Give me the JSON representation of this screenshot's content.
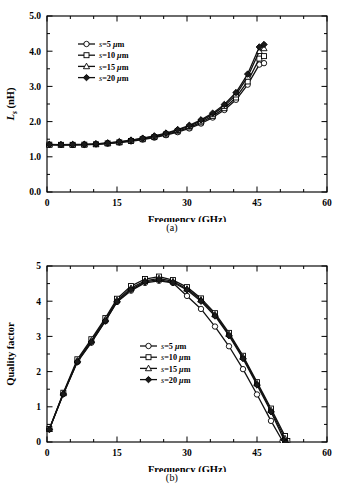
{
  "figure": {
    "panels": [
      {
        "id": "a",
        "caption": "(a)"
      },
      {
        "id": "b",
        "caption": "(b)"
      }
    ]
  },
  "chart_data": [
    {
      "type": "line",
      "panel": "a",
      "title": "",
      "xlabel": "Frequency (GHz)",
      "ylabel": "Ls (nH)",
      "ylabel_parts": {
        "main": "L",
        "sub": "s",
        "unit": " (nH)"
      },
      "xlim": [
        0,
        60
      ],
      "ylim": [
        0.0,
        5.0
      ],
      "xticks": [
        0,
        15,
        30,
        45,
        60
      ],
      "xticklabels": [
        "0",
        "15",
        "30",
        "45",
        "60"
      ],
      "yticks": [
        0.0,
        1.0,
        2.0,
        3.0,
        4.0,
        5.0
      ],
      "yticklabels": [
        "0.0",
        "1.0",
        "2.0",
        "3.0",
        "4.0",
        "5.0"
      ],
      "xminor_step": 5,
      "yminor_step": 0.5,
      "grid": false,
      "legend_position": "upper-left-inside",
      "series": [
        {
          "name": "s=5 µm",
          "marker": "circle",
          "x": [
            0.5,
            3,
            5.5,
            8,
            10.5,
            13,
            15.5,
            18,
            20.5,
            23,
            25.5,
            28,
            30.5,
            33,
            35.5,
            38,
            40.5,
            43,
            45.5,
            46.5
          ],
          "y": [
            1.345,
            1.34,
            1.34,
            1.345,
            1.355,
            1.375,
            1.405,
            1.44,
            1.49,
            1.545,
            1.615,
            1.7,
            1.805,
            1.945,
            2.115,
            2.33,
            2.62,
            3.05,
            3.62,
            3.66
          ]
        },
        {
          "name": "s=10 µm",
          "marker": "square",
          "x": [
            0.5,
            3,
            5.5,
            8,
            10.5,
            13,
            15.5,
            18,
            20.5,
            23,
            25.5,
            28,
            30.5,
            33,
            35.5,
            38,
            40.5,
            43,
            45.5,
            46.5
          ],
          "y": [
            1.345,
            1.34,
            1.34,
            1.345,
            1.355,
            1.38,
            1.41,
            1.45,
            1.5,
            1.56,
            1.635,
            1.725,
            1.835,
            1.98,
            2.155,
            2.38,
            2.685,
            3.14,
            3.79,
            3.86
          ]
        },
        {
          "name": "s=15 µm",
          "marker": "triangle",
          "x": [
            0.5,
            3,
            5.5,
            8,
            10.5,
            13,
            15.5,
            18,
            20.5,
            23,
            25.5,
            28,
            30.5,
            33,
            35.5,
            38,
            40.5,
            43,
            45.5,
            46.5
          ],
          "y": [
            1.345,
            1.34,
            1.345,
            1.35,
            1.365,
            1.39,
            1.42,
            1.465,
            1.52,
            1.58,
            1.66,
            1.755,
            1.87,
            2.02,
            2.205,
            2.44,
            2.765,
            3.27,
            4.0,
            4.08
          ]
        },
        {
          "name": "s=20 µm",
          "marker": "diamond",
          "x": [
            0.5,
            3,
            5.5,
            8,
            10.5,
            13,
            15.5,
            18,
            20.5,
            23,
            25.5,
            28,
            30.5,
            33,
            35.5,
            38,
            40.5,
            43,
            45.5,
            46.5
          ],
          "y": [
            1.35,
            1.345,
            1.35,
            1.355,
            1.37,
            1.395,
            1.43,
            1.475,
            1.53,
            1.595,
            1.675,
            1.775,
            1.895,
            2.05,
            2.24,
            2.485,
            2.825,
            3.35,
            4.12,
            4.19
          ]
        }
      ]
    },
    {
      "type": "line",
      "panel": "b",
      "title": "",
      "xlabel": "Frequency (GHz)",
      "ylabel": "Quality factor",
      "xlim": [
        0,
        60
      ],
      "ylim": [
        0,
        5
      ],
      "xticks": [
        0,
        15,
        30,
        45,
        60
      ],
      "xticklabels": [
        "0",
        "15",
        "30",
        "45",
        "60"
      ],
      "yticks": [
        0,
        1,
        2,
        3,
        4,
        5
      ],
      "yticklabels": [
        "0",
        "1",
        "2",
        "3",
        "4",
        "5"
      ],
      "xminor_step": 5,
      "yminor_step": 0.5,
      "grid": false,
      "legend_position": "center-inside",
      "series": [
        {
          "name": "s=5 µm",
          "marker": "circle",
          "x": [
            0.5,
            3.5,
            6.5,
            9.5,
            12.5,
            15,
            18,
            21,
            24,
            27,
            30,
            33,
            36,
            39,
            42,
            45,
            48,
            50.5,
            51
          ],
          "y": [
            0.36,
            1.37,
            2.27,
            2.82,
            3.43,
            3.98,
            4.3,
            4.52,
            4.58,
            4.52,
            4.15,
            3.78,
            3.28,
            2.72,
            2.07,
            1.35,
            0.6,
            0.02,
            -0.03
          ]
        },
        {
          "name": "s=10 µm",
          "marker": "square",
          "x": [
            0.5,
            3.5,
            6.5,
            9.5,
            12.5,
            15,
            18,
            21,
            24,
            27,
            30,
            33,
            36,
            39,
            42,
            45,
            48,
            51,
            51.5
          ],
          "y": [
            0.37,
            1.4,
            2.35,
            2.92,
            3.52,
            4.07,
            4.43,
            4.63,
            4.7,
            4.6,
            4.4,
            4.08,
            3.66,
            3.1,
            2.45,
            1.7,
            0.95,
            0.17,
            0.03
          ]
        },
        {
          "name": "s=15 µm",
          "marker": "triangle",
          "x": [
            0.5,
            3.5,
            6.5,
            9.5,
            12.5,
            15,
            18,
            21,
            24,
            27,
            30,
            33,
            36,
            39,
            42,
            45,
            48,
            51,
            51.3
          ],
          "y": [
            0.365,
            1.38,
            2.31,
            2.88,
            3.48,
            4.03,
            4.37,
            4.58,
            4.65,
            4.56,
            4.35,
            4.04,
            3.62,
            3.06,
            2.41,
            1.66,
            0.9,
            0.1,
            0.0
          ]
        },
        {
          "name": "s=20 µm",
          "marker": "diamond",
          "x": [
            0.5,
            3.5,
            6.5,
            9.5,
            12.5,
            15,
            18,
            21,
            24,
            27,
            30,
            33,
            36,
            39,
            42,
            45,
            48,
            50.8,
            51.2
          ],
          "y": [
            0.36,
            1.36,
            2.28,
            2.84,
            3.44,
            3.99,
            4.33,
            4.55,
            4.61,
            4.53,
            4.32,
            4.0,
            3.58,
            3.02,
            2.37,
            1.62,
            0.86,
            0.06,
            -0.02
          ]
        }
      ]
    }
  ]
}
